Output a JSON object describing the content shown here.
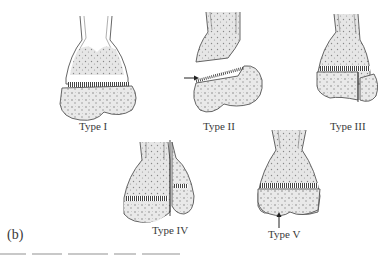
{
  "figure": {
    "panel_label": "(b)",
    "types": [
      {
        "id": "I",
        "label": "Type I"
      },
      {
        "id": "II",
        "label": "Type II"
      },
      {
        "id": "III",
        "label": "Type III"
      },
      {
        "id": "IV",
        "label": "Type IV"
      },
      {
        "id": "V",
        "label": "Type V"
      }
    ]
  },
  "colors": {
    "outline": "#555555",
    "stipple_fill": "#e4e4e4",
    "dot": "#8a8a8a",
    "text": "#3a3a3a"
  }
}
